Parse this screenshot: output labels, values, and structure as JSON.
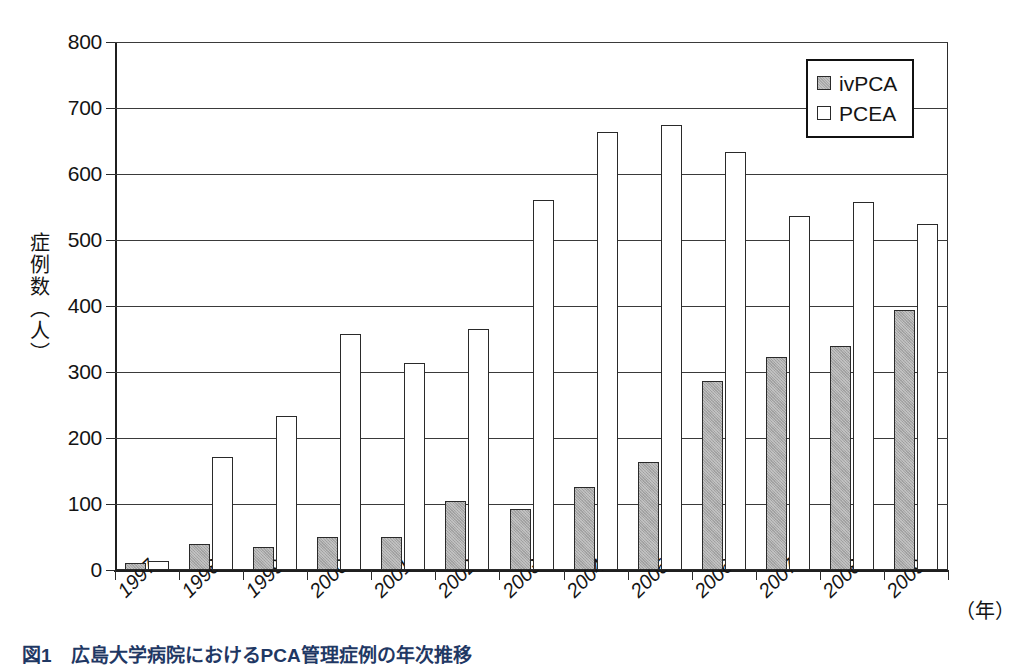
{
  "figure": {
    "caption": "図1　広島大学病院におけるPCA管理症例の年次推移",
    "y_axis_title": "症例数（人）",
    "x_axis_unit": "（年）"
  },
  "legend": {
    "position": "top-right",
    "entries": [
      {
        "label": "ivPCA",
        "color": "#a9a9a9",
        "swatch": "iv"
      },
      {
        "label": "PCEA",
        "color": "#ffffff",
        "swatch": "pcea"
      }
    ]
  },
  "y_ticks": [
    {
      "label": "800",
      "value": 800
    },
    {
      "label": "700",
      "value": 700
    },
    {
      "label": "600",
      "value": 600
    },
    {
      "label": "500",
      "value": 500
    },
    {
      "label": "400",
      "value": 400
    },
    {
      "label": "300",
      "value": 300
    },
    {
      "label": "200",
      "value": 200
    },
    {
      "label": "100",
      "value": 100
    },
    {
      "label": "0",
      "value": 0
    }
  ],
  "chart_data": {
    "type": "bar",
    "title": "図1　広島大学病院におけるPCA管理症例の年次推移",
    "xlabel": "（年）",
    "ylabel": "症例数（人）",
    "ylim": [
      0,
      800
    ],
    "ytick_step": 100,
    "grid": true,
    "legend_position": "top-right",
    "categories": [
      "1997",
      "1998",
      "1999",
      "2000",
      "2001",
      "2002",
      "2003",
      "2004",
      "2005",
      "2006",
      "2007",
      "2008",
      "2009"
    ],
    "series": [
      {
        "name": "ivPCA",
        "color": "#a9a9a9",
        "values": [
          10,
          40,
          35,
          50,
          50,
          104,
          93,
          126,
          164,
          287,
          322,
          339,
          394
        ]
      },
      {
        "name": "PCEA",
        "color": "#ffffff",
        "values": [
          13,
          171,
          233,
          358,
          313,
          365,
          561,
          663,
          674,
          634,
          537,
          557,
          525
        ]
      }
    ]
  }
}
